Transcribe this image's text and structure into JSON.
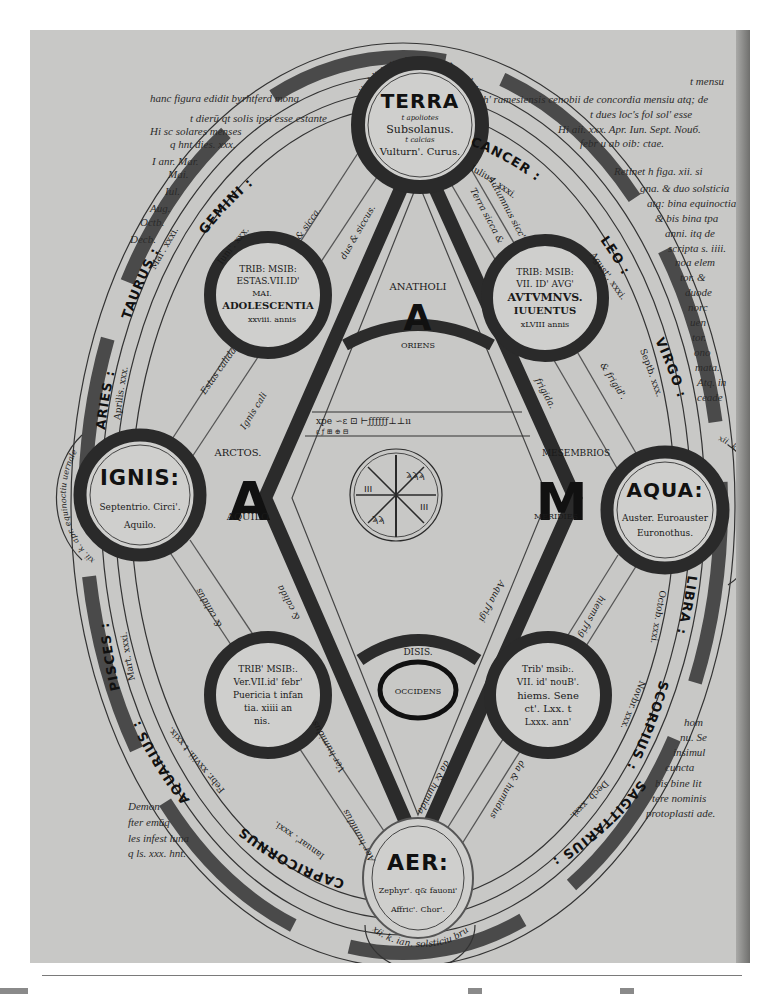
{
  "document": {
    "type": "manuscript-diagram",
    "colors": {
      "page": "#c8c8c6",
      "ink": "#1a1a1a",
      "band": "#3a3a3a",
      "paper_bg": "#ffffff"
    }
  },
  "elements": {
    "terra": {
      "name": "TERRA",
      "line1": "t apoliotes",
      "line2": "Subsolanus.",
      "line3": "t calcias",
      "line4": "Vulturn'. Curus."
    },
    "aer": {
      "name": "AER:",
      "line1": "Zephyr'. q& fauoni'",
      "line2": "Affric'. Chor'."
    },
    "ignis": {
      "name": "IGNIS:",
      "line1": "Septentrio. Circi'.",
      "line2": "Aquilo."
    },
    "aqua": {
      "name": "AQUA:",
      "line1": "Auster. Euroauster",
      "line2": "Euronothus."
    }
  },
  "seasons": {
    "aestas": {
      "l1": "TRIB: MSIB:",
      "l2": "ESTAS.VII.ID'",
      "l3": "MAI.",
      "l4": "ADOLESCENTIA",
      "l5": "xxviii. annis"
    },
    "autumnus": {
      "l1": "TRIB: MSIB:",
      "l2": "VII. ID' AVG'",
      "l3": "AVTVMNVS.",
      "l4": "IUUENTUS",
      "l5": "xLVIII annis"
    },
    "ver": {
      "l1": "TRIB' MSIB:.",
      "l2": "Ver.VII.id' febr'",
      "l3": "Puericia t infan",
      "l4": "tia. xiiii an",
      "l5": "nis."
    },
    "hiems": {
      "l1": "Trib' msib:.",
      "l2": "VII. id' nouB'.",
      "l3": "hiems. Sene",
      "l4": "ct'. Lxx. t",
      "l5": "Lxxx. ann'"
    }
  },
  "directions": {
    "east": {
      "letter": "A",
      "word": "ANATHOLI",
      "label": "ORIENS"
    },
    "north": {
      "letter": "A",
      "word": "ARCTOS.",
      "label": "AQUILO"
    },
    "south": {
      "letter": "M",
      "word": "MESEMBRIOS",
      "label": "MERIDIES"
    },
    "west": {
      "letter": "O",
      "word": "DISIS.",
      "label": "OCCIDENS"
    }
  },
  "qualities": {
    "tl": "Estas calida",
    "tl2": "& sicca.",
    "tl3": "Ignis cali",
    "tl4": "dus & siccus.",
    "tr": "Terra sicca &",
    "tr2": "Autumnus sicc'",
    "tr3": "& frigid'.",
    "tr4": "frigida.",
    "bl": "& calidus",
    "bl2": "Ver humidus",
    "bl3": "& calida",
    "bl4": "Aer humidus",
    "br": "Aqua frigi",
    "br2": "hiems frig",
    "br3": "da & humida",
    "br4": "da & humidus"
  },
  "zodiac": {
    "gemini": "GEMINI :",
    "cancer": "CANCER :",
    "leo": "LEO :",
    "virgo": "VIRGO :",
    "libra": "LIBRA :",
    "scorpius": "SCORPIUS :",
    "sagittarius": "SAGITTARIUS :",
    "capricornus": "CAPRICORNUS",
    "aquarius": "AQUARIUS :",
    "pisces": "PISCES :",
    "aries": "ARIES :",
    "taurus": "TAURUS :"
  },
  "months": {
    "gemini": "Iuni'. xxx.",
    "gemini2": "Lv. xxx.",
    "cancer": "Iulius. xxxi.",
    "cancer2": "Lv. xxix.",
    "leo": "Agust'. xxxi.",
    "leo2": "Lv. xxx.",
    "virgo": "Septb. xxx.",
    "virgo2": "Lv. xxix.",
    "libra": "Octob. xxxi.",
    "libra2": "Lv. xxx. Lv. xxx.",
    "scorpius": "Novbr. xxx.",
    "scorpius2": "Lv. xxix.",
    "sagittarius": "Decb. xxxi.",
    "sagittarius2": "Lv. xxx.",
    "capricornus": "Ianuar'. xxxi.",
    "capricornus2": "Lv. xxx.",
    "aquarius": "Febr. xxviii. t xxix.",
    "aquarius2": "Lv. xxix.",
    "pisces": "Mart. xxxi.",
    "pisces2": "Lv. xxx.",
    "aries": "Aprilis. xxx.",
    "aries2": "Lv. xxix.",
    "taurus": "Mai'. xxxi.",
    "taurus2": "Lv. xxx."
  },
  "solstice_arcs": {
    "top": "xii. kl' iul'. Avtvmnale solsticiu",
    "bottom": "xii. k. ian. solsticiu brumale",
    "left": "xii. k. apr. equinoctiu uernale",
    "right": "xii. k. oct. autumnale"
  },
  "marginalia": {
    "top_left": "hanc figura edidit byrhtferd mona",
    "top_right": "ch' ramesiensis cenobii de concordia mensiu atq; de",
    "top_right_gloss": "t mensu",
    "left_gloss": "t dierū qt solis ipsi esse cstante",
    "left_h": "Hi sc solares menses",
    "left_h2": "q hnt dies. xxx.",
    "left_i": "I anr. Mar.",
    "left_list": [
      "Mai.",
      "Iul.",
      "Aug.",
      "Octb.",
      "Decb."
    ],
    "right_h_gloss": "t dues loc's fol sol' esse",
    "right_h": "Hi aii. xxx. Apr. Iun. Sept. Nouб.",
    "right_h2": "febr u ab oib: ctae.",
    "right_r": [
      "Retinet h figa. xii. si",
      "gna. & duo solsticia",
      "atq: bina equinoctia",
      "& bis bina tpa",
      "anni. itq de",
      "scripta s. iiii.",
      "noa elem",
      "tor. &",
      "duode",
      "norc",
      "uen",
      "tor.",
      "ono",
      "mata.",
      "Atq. in",
      "ceade"
    ],
    "right_bottom": [
      "hom",
      "nu. Se",
      "insimul",
      "cuncta",
      "bis bine lit",
      "tere nominis",
      "protoplasti ade."
    ],
    "left_bottom": [
      "Demon",
      "fter emūq",
      "les infest luna",
      "q ls. xxx. hnt."
    ]
  },
  "center": {
    "runes_row1": "xpe  ∽ε  ⊡  ⊢ƒƒƒƒƒƒ⊥⊥ıı",
    "runes_row2": "ε ƒ ⊞ ⊕  ⊟"
  }
}
